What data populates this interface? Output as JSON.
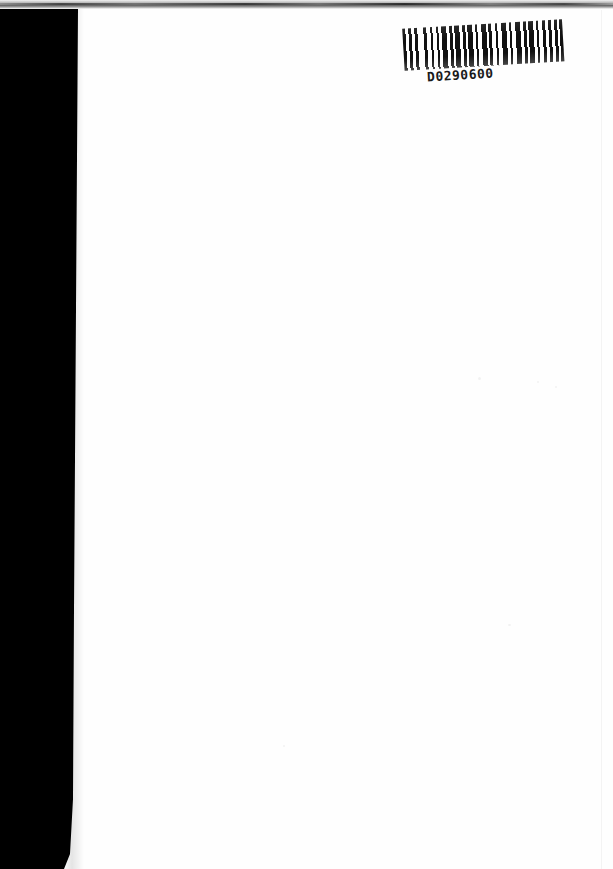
{
  "page": {
    "kind": "scanned-book-page",
    "orientation": "portrait",
    "width_px": 613,
    "height_px": 869,
    "paper_color": "#fefefe",
    "content_description": "blank recto page with library barcode label at top right",
    "body_text": ""
  },
  "artifacts": {
    "gutter_shadow": {
      "name": "binding-gutter-shadow",
      "color": "#000000",
      "side": "left"
    },
    "top_edge_band": {
      "name": "scanner-top-edge-band",
      "color": "#3a3a3a"
    },
    "page_edge_line": {
      "name": "paper-right-edge",
      "color": "#00000012"
    }
  },
  "barcode": {
    "label_name": "library-barcode-label",
    "symbology": "Code 39",
    "human_readable_number": "D0290600",
    "rotation_deg": -3.4,
    "ink_color": "#111111"
  }
}
